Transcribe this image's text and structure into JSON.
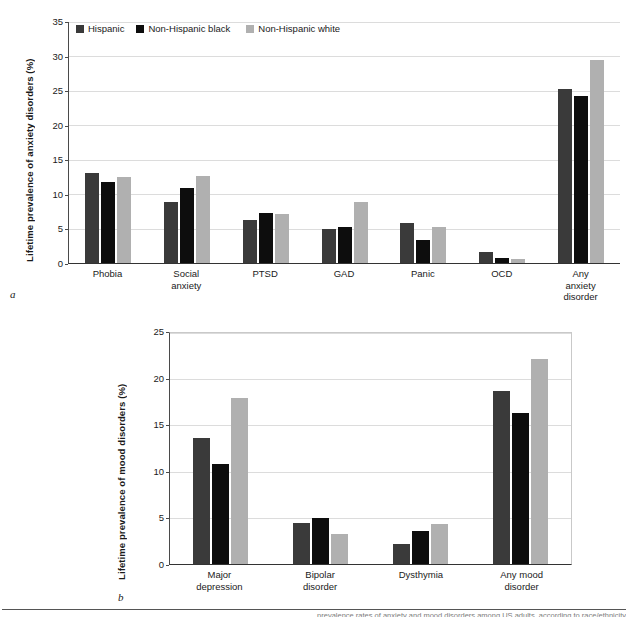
{
  "figure": {
    "panel_a_letter": "a",
    "panel_b_letter": "b",
    "footer_caption": "prevalence rates of anxiety and mood disorders among US adults, according to race/ethnicity"
  },
  "legend": {
    "items": [
      {
        "label": "Hispanic",
        "color": "#3a3a3a"
      },
      {
        "label": "Non-Hispanic black",
        "color": "#0d0d0d"
      },
      {
        "label": "Non-Hispanic white",
        "color": "#b0b0b0"
      }
    ]
  },
  "chart_data": [
    {
      "id": "anxiety",
      "type": "bar",
      "title": "",
      "xlabel": "",
      "ylabel": "Lifetime prevalence of anxiety disorders (%)",
      "ylim": [
        0,
        35
      ],
      "yticks": [
        0,
        5,
        10,
        15,
        20,
        25,
        30,
        35
      ],
      "grid": true,
      "legend_position": "top-left-inside",
      "categories": [
        "Phobia",
        "Social\nanxiety",
        "PTSD",
        "GAD",
        "Panic",
        "OCD",
        "Any\nanxiety\ndisorder"
      ],
      "series": [
        {
          "name": "Hispanic",
          "color": "#3a3a3a",
          "values": [
            13.1,
            8.9,
            6.3,
            5.0,
            5.8,
            1.6,
            25.3
          ]
        },
        {
          "name": "Non-Hispanic black",
          "color": "#0d0d0d",
          "values": [
            11.8,
            10.9,
            7.3,
            5.2,
            3.4,
            0.8,
            24.3
          ]
        },
        {
          "name": "Non-Hispanic white",
          "color": "#b0b0b0",
          "values": [
            12.5,
            12.6,
            7.1,
            8.9,
            5.2,
            0.6,
            29.5
          ]
        }
      ]
    },
    {
      "id": "mood",
      "type": "bar",
      "title": "",
      "xlabel": "",
      "ylabel": "Lifetime prevalence of mood disorders (%)",
      "ylim": [
        0,
        25
      ],
      "yticks": [
        0,
        5,
        10,
        15,
        20,
        25
      ],
      "grid": true,
      "legend_position": "none",
      "categories": [
        "Major\ndepression",
        "Bipolar\ndisorder",
        "Dysthymia",
        "Any mood\ndisorder"
      ],
      "series": [
        {
          "name": "Hispanic",
          "color": "#3a3a3a",
          "values": [
            13.6,
            4.4,
            2.2,
            18.7
          ]
        },
        {
          "name": "Non-Hispanic black",
          "color": "#0d0d0d",
          "values": [
            10.8,
            5.0,
            3.6,
            16.3
          ]
        },
        {
          "name": "Non-Hispanic white",
          "color": "#b0b0b0",
          "values": [
            18.0,
            3.2,
            4.3,
            22.2
          ]
        }
      ]
    }
  ]
}
